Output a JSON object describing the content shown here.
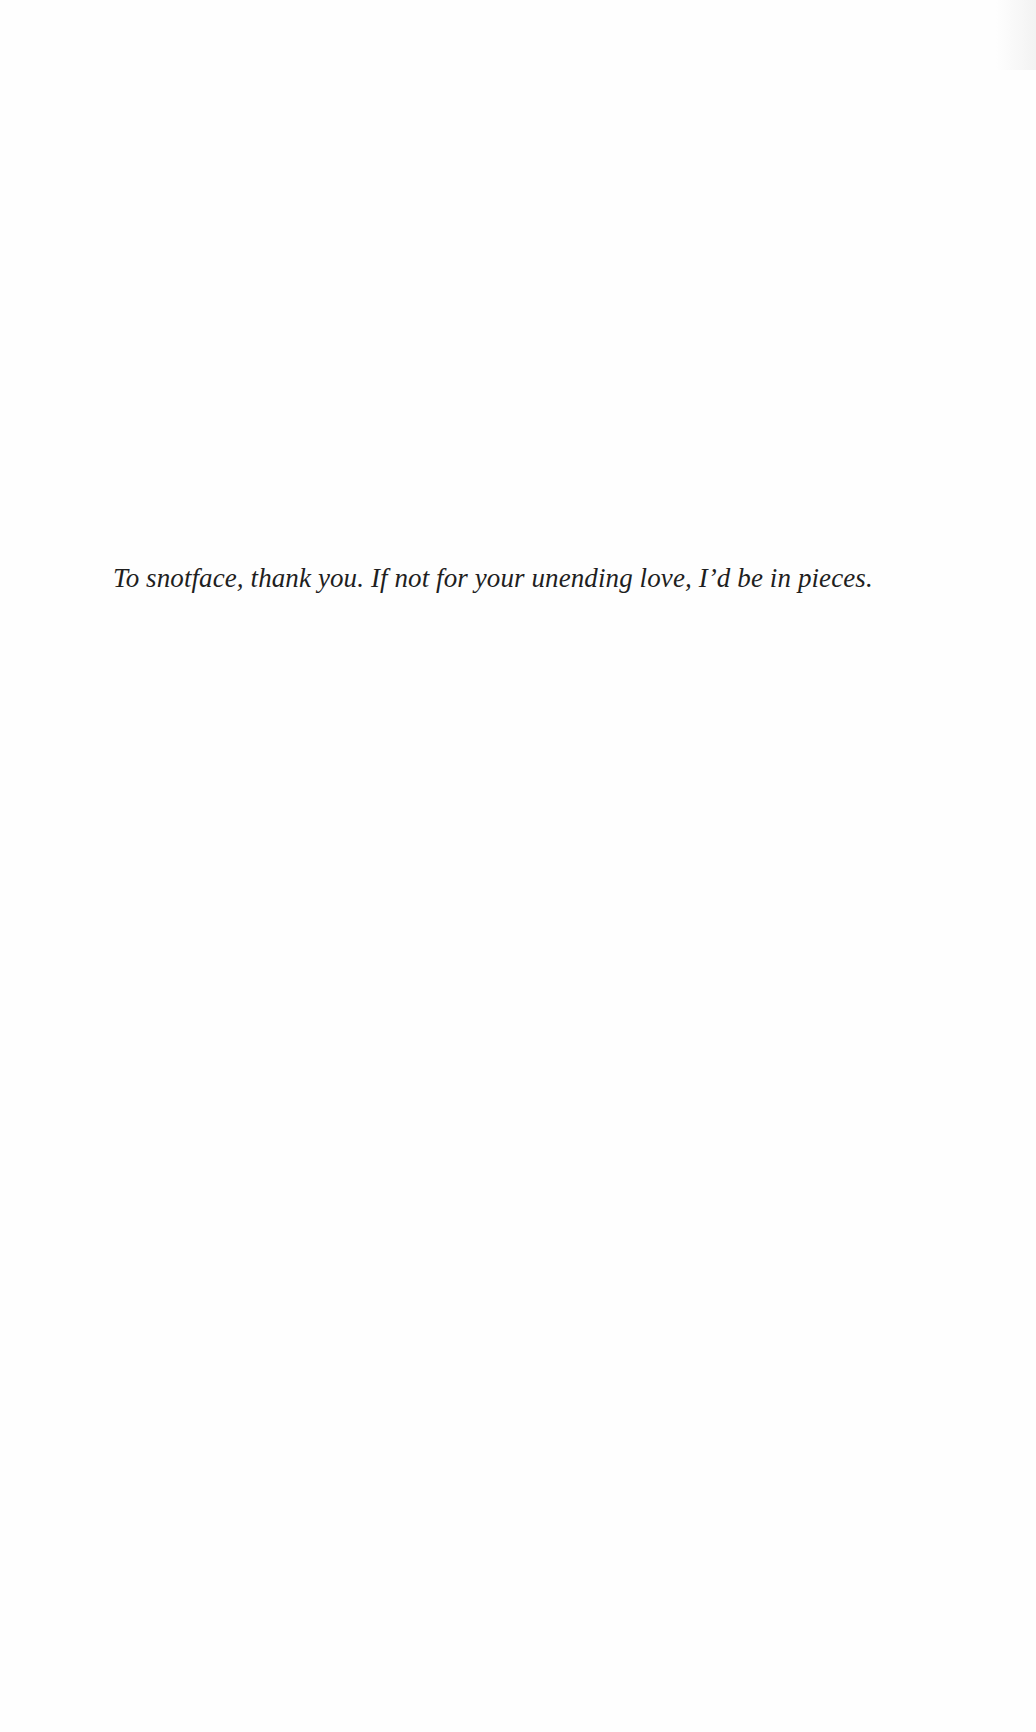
{
  "page": {
    "type": "dedication",
    "background_color": "#ffffff",
    "text_color": "#1f1f1f"
  },
  "dedication": {
    "text": "To snotface, thank you. If not for your unending love, I’d be in pieces."
  }
}
